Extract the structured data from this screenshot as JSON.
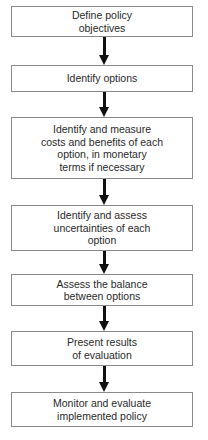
{
  "diagram": {
    "type": "flowchart",
    "direction": "top-to-bottom",
    "steps": [
      {
        "id": "step-1",
        "lines": [
          "Define policy",
          "objectives"
        ]
      },
      {
        "id": "step-2",
        "lines": [
          "Identify options"
        ]
      },
      {
        "id": "step-3",
        "lines": [
          "Identify and measure",
          "costs and benefits of each",
          "option, in monetary",
          "terms if necessary"
        ]
      },
      {
        "id": "step-4",
        "lines": [
          "Identify and assess",
          "uncertainties of each",
          "option"
        ]
      },
      {
        "id": "step-5",
        "lines": [
          "Assess the balance",
          "between options"
        ]
      },
      {
        "id": "step-6",
        "lines": [
          "Present results",
          "of evaluation"
        ]
      },
      {
        "id": "step-7",
        "lines": [
          "Monitor and evaluate",
          "implemented policy"
        ]
      }
    ],
    "edges": [
      {
        "from": "step-1",
        "to": "step-2"
      },
      {
        "from": "step-2",
        "to": "step-3"
      },
      {
        "from": "step-3",
        "to": "step-4"
      },
      {
        "from": "step-4",
        "to": "step-5"
      },
      {
        "from": "step-5",
        "to": "step-6"
      },
      {
        "from": "step-6",
        "to": "step-7"
      }
    ],
    "colors": {
      "box_border": "#8a8a8a",
      "text": "#2a2a2a",
      "arrow": "#111111",
      "background": "#ffffff"
    }
  }
}
